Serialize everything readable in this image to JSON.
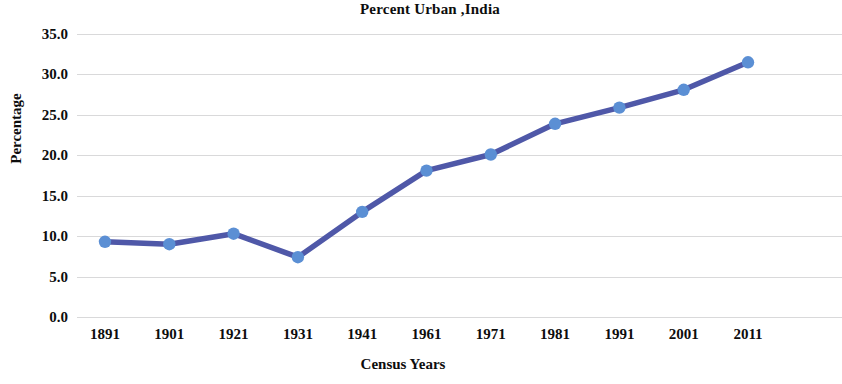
{
  "chart_data": {
    "type": "line",
    "title": "Percent Urban ,India",
    "xlabel": "Census Years",
    "ylabel": "Percentage",
    "categories": [
      "1891",
      "1901",
      "1921",
      "1931",
      "1941",
      "1961",
      "1971",
      "1981",
      "1991",
      "2001",
      "2011"
    ],
    "values": [
      9.3,
      9.0,
      10.3,
      7.4,
      13.0,
      18.1,
      20.1,
      23.9,
      25.9,
      28.1,
      31.5
    ],
    "series": [
      {
        "name": "Percent Urban",
        "values": [
          9.3,
          9.0,
          10.3,
          7.4,
          13.0,
          18.1,
          20.1,
          23.9,
          25.9,
          28.1,
          31.5
        ]
      }
    ],
    "ylim": [
      0.0,
      35.0
    ],
    "ytick_labels": [
      "0.0",
      "5.0",
      "10.0",
      "15.0",
      "20.0",
      "25.0",
      "30.0",
      "35.0"
    ],
    "ytick_values": [
      0.0,
      5.0,
      10.0,
      15.0,
      20.0,
      25.0,
      30.0,
      35.0
    ],
    "grid": true,
    "legend": false,
    "line_color": "#4F58A8",
    "marker_color": "#5B8FD4",
    "grid_color": "#D2D2D4",
    "background": "#FFFFFF"
  }
}
